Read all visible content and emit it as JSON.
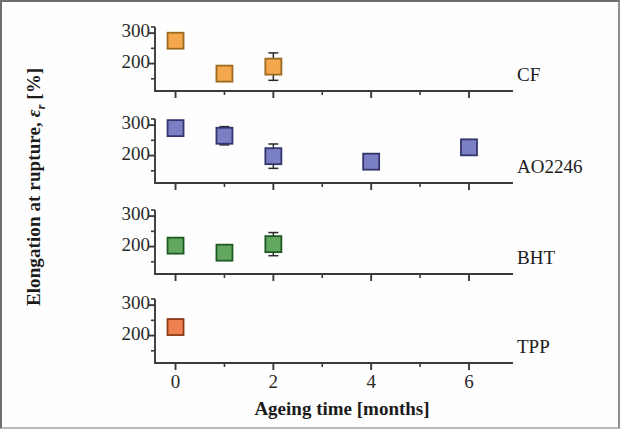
{
  "chart_data": {
    "type": "scatter",
    "title": "",
    "xlabel": "Ageing time [months]",
    "ylabel_parts": {
      "main": "Elongation at rupture, ",
      "symbol": "ε",
      "subscript": "r",
      "unit": "  [%]"
    },
    "ylabel": "Elongation at rupture, εr  [%]",
    "x": [
      0,
      1,
      2,
      4,
      6
    ],
    "xlim": [
      -0.42,
      6.9
    ],
    "xticks_major": [
      0,
      2,
      4,
      6
    ],
    "xticks_major_labels": [
      "0",
      "2",
      "4",
      "6"
    ],
    "xticks_minor": [
      1,
      3,
      5
    ],
    "ylim": [
      110,
      320
    ],
    "yticks_major": [
      200,
      300
    ],
    "yticks_major_labels": [
      "200",
      "300"
    ],
    "yticks_minor": [
      150,
      250
    ],
    "grid": false,
    "legend_position": "panel-right-inside",
    "error_bars": "symmetric vertical",
    "panels": [
      {
        "name": "CF",
        "label": "CF",
        "color": "#f5a84b",
        "edge_color": "#9a6a20",
        "points": [
          {
            "x": 0,
            "y": 275,
            "err": 10
          },
          {
            "x": 1,
            "y": 167,
            "err": 12
          },
          {
            "x": 2,
            "y": 190,
            "err": 45
          }
        ]
      },
      {
        "name": "AO2246",
        "label": "AO2246",
        "color": "#7b7fc4",
        "edge_color": "#33356d",
        "points": [
          {
            "x": 0,
            "y": 290,
            "err": 18
          },
          {
            "x": 1,
            "y": 265,
            "err": 30
          },
          {
            "x": 2,
            "y": 198,
            "err": 40
          },
          {
            "x": 4,
            "y": 180,
            "err": 8
          },
          {
            "x": 6,
            "y": 227,
            "err": 10
          }
        ]
      },
      {
        "name": "BHT",
        "label": "BHT",
        "color": "#62a860",
        "edge_color": "#1f5a25",
        "points": [
          {
            "x": 0,
            "y": 203,
            "err": 22
          },
          {
            "x": 1,
            "y": 180,
            "err": 18
          },
          {
            "x": 2,
            "y": 208,
            "err": 38
          }
        ]
      },
      {
        "name": "TPP",
        "label": "TPP",
        "color": "#ef8150",
        "edge_color": "#8e3a15",
        "points": [
          {
            "x": 0,
            "y": 228,
            "err": 15
          }
        ]
      }
    ]
  },
  "axis_style": {
    "line_color": "#3b3b3b",
    "text_color": "#1c1c1c",
    "background": "#fefefe"
  }
}
